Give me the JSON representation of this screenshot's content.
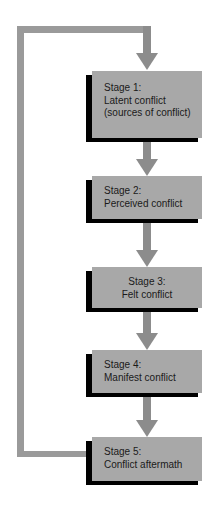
{
  "diagram": {
    "type": "flowchart",
    "colors": {
      "box_fill": "#a8a8a8",
      "box_shadow": "#000000",
      "arrow": "#8c8c8c",
      "loop_line": "#9a9a9a"
    },
    "stages": [
      {
        "title": "Stage 1:",
        "line1": "Latent conflict",
        "line2": "(sources of conflict)"
      },
      {
        "title": "Stage 2:",
        "line1": "Perceived conflict",
        "line2": ""
      },
      {
        "title": "Stage 3:",
        "line1": "Felt conflict",
        "line2": ""
      },
      {
        "title": "Stage 4:",
        "line1": "Manifest conflict",
        "line2": ""
      },
      {
        "title": "Stage 5:",
        "line1": "Conflict aftermath",
        "line2": ""
      }
    ],
    "feedback_loop": {
      "from": "Stage 5",
      "to": "Stage 1"
    }
  }
}
